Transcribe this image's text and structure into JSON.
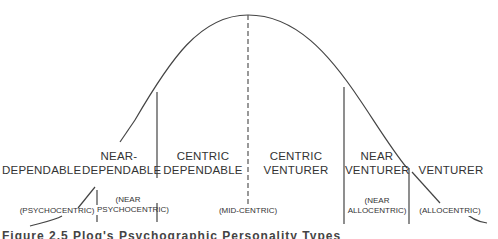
{
  "diagram": {
    "type": "bell-curve-segmentation",
    "segments": [
      {
        "label": "DEPENDABLE",
        "sublabel": "(PSYCHOCENTRIC)"
      },
      {
        "label": "NEAR-\nDEPENDABLE",
        "sublabel": "(NEAR\nPSYCHOCENTRIC)"
      },
      {
        "label": "CENTRIC\nDEPENDABLE",
        "sublabel": ""
      },
      {
        "label": "CENTRIC\nVENTURER",
        "sublabel": ""
      },
      {
        "label": "NEAR\nVENTURER",
        "sublabel": "(NEAR\nALLOCENTRIC)"
      },
      {
        "label": "VENTURER",
        "sublabel": "(ALLOCENTRIC)"
      }
    ],
    "center_sublabel": "(MID-CENTRIC)",
    "labels": {
      "dependable": "DEPENDABLE",
      "near_dependable_1": "NEAR-",
      "near_dependable_2": "DEPENDABLE",
      "centric_dependable_1": "CENTRIC",
      "centric_dependable_2": "DEPENDABLE",
      "centric_venturer_1": "CENTRIC",
      "centric_venturer_2": "VENTURER",
      "near_venturer_1": "NEAR",
      "near_venturer_2": "VENTURER",
      "venturer": "VENTURER",
      "psychocentric": "(PSYCHOCENTRIC)",
      "near_psychocentric_1": "(NEAR",
      "near_psychocentric_2": "PSYCHOCENTRIC)",
      "mid_centric": "(MID-CENTRIC)",
      "near_allocentric_1": "(NEAR",
      "near_allocentric_2": "ALLOCENTRIC)",
      "allocentric": "(ALLOCENTRIC)"
    },
    "caption": "Figure 2.5  Plog's Psychographic Personality Types"
  }
}
